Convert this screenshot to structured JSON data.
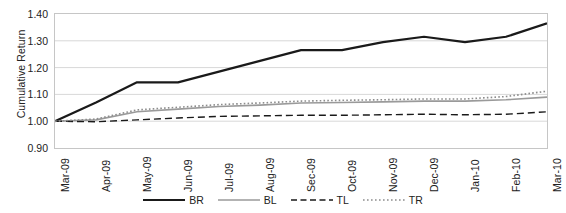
{
  "chart_data": {
    "type": "line",
    "title": "",
    "xlabel": "",
    "ylabel": "Cumulative Return",
    "ylim": [
      0.9,
      1.4
    ],
    "ytick_values": [
      1.4,
      1.3,
      1.2,
      1.1,
      1.0,
      0.9
    ],
    "ytick_labels": [
      "1.40",
      "1.30",
      "1.20",
      "1.10",
      "1.00",
      "0.90"
    ],
    "grid": true,
    "legend_position": "bottom",
    "categories": [
      "Mar-09",
      "Apr-09",
      "May-09",
      "Jun-09",
      "Jul-09",
      "Aug-09",
      "Sec-09",
      "Oct-09",
      "Nov-09",
      "Dec-09",
      "Jan-10",
      "Feb-10",
      "Mar-10"
    ],
    "series": [
      {
        "name": "BR",
        "style": "solid",
        "color": "#1a1a1a",
        "width": 2.2,
        "values": [
          1.0,
          1.07,
          1.145,
          1.145,
          1.185,
          1.225,
          1.265,
          1.265,
          1.295,
          1.315,
          1.295,
          1.315,
          1.365
        ]
      },
      {
        "name": "BL",
        "style": "solid",
        "color": "#9a9a9a",
        "width": 1.6,
        "values": [
          1.0,
          1.005,
          1.035,
          1.045,
          1.055,
          1.06,
          1.068,
          1.07,
          1.072,
          1.075,
          1.075,
          1.08,
          1.09
        ]
      },
      {
        "name": "TL",
        "style": "dashed",
        "color": "#1a1a1a",
        "width": 1.4,
        "values": [
          1.0,
          0.998,
          1.005,
          1.012,
          1.018,
          1.02,
          1.022,
          1.022,
          1.024,
          1.026,
          1.024,
          1.026,
          1.035
        ]
      },
      {
        "name": "TR",
        "style": "dotted",
        "color": "#8d8d8d",
        "width": 1.6,
        "values": [
          1.0,
          1.008,
          1.042,
          1.052,
          1.062,
          1.068,
          1.075,
          1.078,
          1.08,
          1.083,
          1.083,
          1.092,
          1.112
        ]
      }
    ]
  },
  "legend": {
    "items": [
      {
        "label": "BR"
      },
      {
        "label": "BL"
      },
      {
        "label": "TL"
      },
      {
        "label": "TR"
      }
    ]
  }
}
